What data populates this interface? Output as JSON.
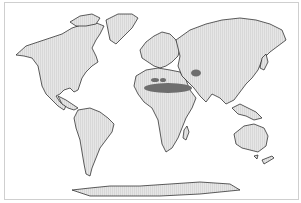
{
  "map": {
    "type": "world-distribution-map",
    "projection": "world outline, Pacific split",
    "colors": {
      "land": "#e4e4e4",
      "coast": "#1a1a1a",
      "highlight": "#6e6e6e",
      "background": "#ffffff",
      "frame": "#cfcfcf"
    },
    "continents": [
      {
        "name": "North America"
      },
      {
        "name": "Greenland"
      },
      {
        "name": "South America"
      },
      {
        "name": "Europe"
      },
      {
        "name": "Africa"
      },
      {
        "name": "Asia"
      },
      {
        "name": "Australia"
      },
      {
        "name": "New Zealand"
      },
      {
        "name": "Antarctica"
      }
    ],
    "highlighted_regions": [
      {
        "name": "Sahara band",
        "location": "North Africa"
      },
      {
        "name": "Northwest Africa patch",
        "location": "Northwest Africa"
      },
      {
        "name": "Central Asia patch",
        "location": "Central Asia"
      }
    ]
  }
}
